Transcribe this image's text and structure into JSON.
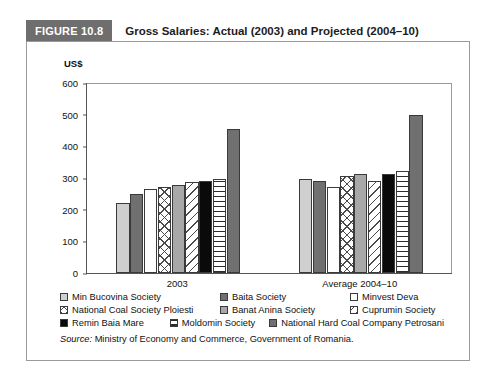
{
  "figure": {
    "badge": "FIGURE 10.8",
    "title": "Gross Salaries: Actual (2003) and Projected (2004–10)",
    "badge_color": "#6e6e6e"
  },
  "source": {
    "prefix": "Source:",
    "text": " Ministry of Economy and Commerce, Government of Romania."
  },
  "legend": {
    "rows": [
      [
        {
          "label": "Min Bucovina Society",
          "pattern": "p-lightgray",
          "icon": "legend-swatch-light-gray"
        },
        {
          "label": "Baita Society",
          "pattern": "p-darkgray",
          "icon": "legend-swatch-dark-gray"
        },
        {
          "label": "Minvest Deva",
          "pattern": "p-white",
          "icon": "legend-swatch-white"
        }
      ],
      [
        {
          "label": "National Coal Society Ploiesti",
          "pattern": "p-cross",
          "icon": "legend-swatch-crosshatch"
        },
        {
          "label": "Banat Anina Society",
          "pattern": "p-medgray",
          "icon": "legend-swatch-medium-gray"
        },
        {
          "label": "Cuprumin Society",
          "pattern": "p-diag",
          "icon": "legend-swatch-diagonal"
        }
      ],
      [
        {
          "label": "Remin Baia Mare",
          "pattern": "p-black",
          "icon": "legend-swatch-black"
        },
        {
          "label": "Moldomin Society",
          "pattern": "p-hlines",
          "icon": "legend-swatch-horizontal-lines"
        },
        {
          "label": "National Hard Coal Company Petrosani",
          "pattern": "p-darkgray",
          "icon": "legend-swatch-dark-gray-2"
        }
      ]
    ]
  },
  "chart_data": {
    "type": "bar",
    "title": "Gross Salaries: Actual (2003) and Projected (2004–10)",
    "xlabel": "",
    "ylabel": "US$",
    "ylim": [
      0,
      600
    ],
    "yticks": [
      0,
      100,
      200,
      300,
      400,
      500,
      600
    ],
    "grid": false,
    "legend_position": "bottom",
    "categories": [
      "2003",
      "Average 2004–10"
    ],
    "series": [
      {
        "name": "Min Bucovina Society",
        "pattern": "p-lightgray",
        "values": [
          220,
          297
        ]
      },
      {
        "name": "Baita Society",
        "pattern": "p-darkgray",
        "values": [
          248,
          290
        ]
      },
      {
        "name": "Minvest Deva",
        "pattern": "p-white",
        "values": [
          265,
          272
        ]
      },
      {
        "name": "National Coal Society Ploiesti",
        "pattern": "p-cross",
        "values": [
          272,
          305
        ]
      },
      {
        "name": "Banat Anina Society",
        "pattern": "p-medgray",
        "values": [
          278,
          312
        ]
      },
      {
        "name": "Cuprumin Society",
        "pattern": "p-diag",
        "values": [
          288,
          290
        ]
      },
      {
        "name": "Remin Baia Mare",
        "pattern": "p-black",
        "values": [
          290,
          312
        ]
      },
      {
        "name": "Moldomin Society",
        "pattern": "p-hlines",
        "values": [
          296,
          323
        ]
      },
      {
        "name": "National Hard Coal Company Petrosani",
        "pattern": "p-darkgray",
        "values": [
          455,
          500
        ]
      }
    ]
  }
}
